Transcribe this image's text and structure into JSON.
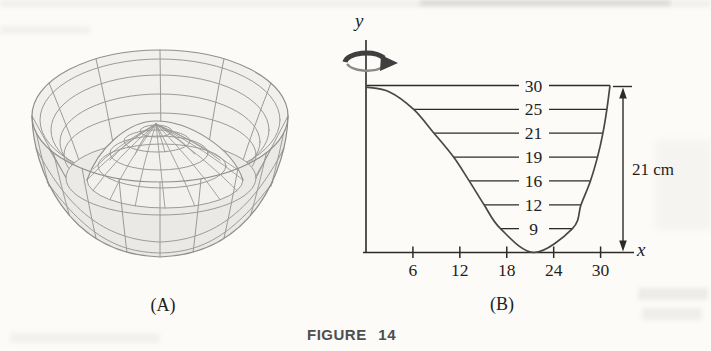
{
  "figure": {
    "caption": "FIGURE 14",
    "panel_a_label": "(A)",
    "panel_b_label": "(B)"
  },
  "colors": {
    "ink": "#2b2b2b",
    "curve": "#474747",
    "wireframe": "#9a9a98",
    "caption_gray": "#4f4f4f",
    "rotation_arrow": "#3f3f3f",
    "paper": "#fcfbf8"
  },
  "chart_data": [
    {
      "panel": "A",
      "type": "surface-3d",
      "description": "Wireframe surface of revolution: a bowl with a central dome bump, generated by rotating the curve of panel B about the y-axis",
      "label": "(A)"
    },
    {
      "panel": "B",
      "type": "line",
      "label": "(B)",
      "xlabel": "x",
      "ylabel": "y",
      "x_ticks": [
        6,
        12,
        18,
        24,
        30
      ],
      "xlim": [
        0,
        34
      ],
      "height_cm": 21,
      "height_label": "21 cm",
      "rotation_axis": "y",
      "level_lines": [
        {
          "label": "30",
          "height_cm": 21,
          "x_left": 0,
          "x_right": 31.2
        },
        {
          "label": "25",
          "height_cm": 18,
          "x_left": 6.1,
          "x_right": 30.8
        },
        {
          "label": "21",
          "height_cm": 15,
          "x_left": 8.7,
          "x_right": 30.3
        },
        {
          "label": "19",
          "height_cm": 12,
          "x_left": 11.2,
          "x_right": 29.6
        },
        {
          "label": "16",
          "height_cm": 9,
          "x_left": 13.2,
          "x_right": 28.7
        },
        {
          "label": "12",
          "height_cm": 6,
          "x_left": 15.1,
          "x_right": 27.5
        },
        {
          "label": "9",
          "height_cm": 3,
          "x_left": 17.2,
          "x_right": 26.4
        }
      ],
      "curve_points": [
        [
          0,
          20.8
        ],
        [
          3,
          20.2
        ],
        [
          6.1,
          18
        ],
        [
          8.7,
          15
        ],
        [
          11.2,
          12
        ],
        [
          13.2,
          9
        ],
        [
          15.1,
          6
        ],
        [
          17.2,
          3
        ],
        [
          21.5,
          0
        ],
        [
          26.4,
          3
        ],
        [
          27.5,
          6
        ],
        [
          28.7,
          9
        ],
        [
          29.6,
          12
        ],
        [
          30.3,
          15
        ],
        [
          30.8,
          18
        ],
        [
          31.2,
          21
        ]
      ]
    }
  ]
}
